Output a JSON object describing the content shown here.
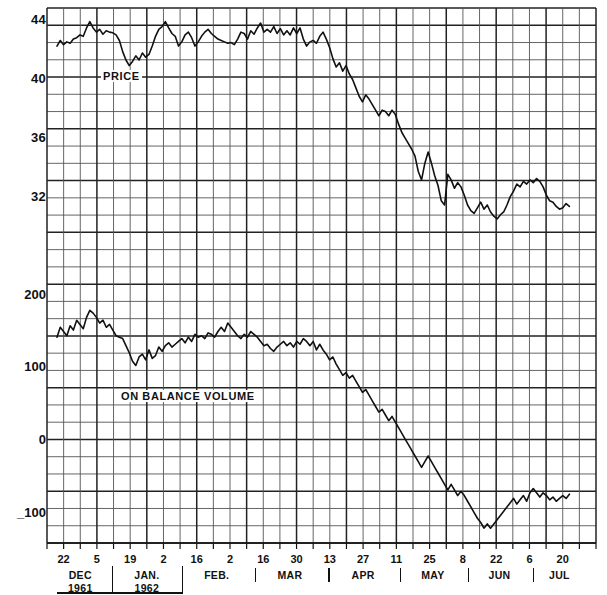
{
  "figure": {
    "background": "#ffffff",
    "line_color": "#111111",
    "grid_color": "#555555",
    "grid_bold_color": "#222222"
  },
  "panels": {
    "price": {
      "label": "PRICE",
      "y_ticks": [
        44,
        40,
        36,
        32
      ],
      "y_tick_labels": [
        "44",
        "40",
        "36",
        "32"
      ],
      "ylim": [
        28.0,
        45.33
      ]
    },
    "obv": {
      "label": "ON  BALANCE  VOLUME",
      "y_ticks": [
        200,
        100,
        0,
        -100
      ],
      "y_tick_labels": [
        "200",
        "100",
        "0",
        "_100"
      ],
      "ylim": [
        -133,
        233
      ]
    }
  },
  "x_axis": {
    "day_ticks": [
      "22",
      "5",
      "19",
      "2",
      "16",
      "2",
      "16",
      "30",
      "13",
      "27",
      "11",
      "25",
      "8",
      "22",
      "6",
      "20"
    ],
    "months": [
      {
        "name": "DEC",
        "year": "1961"
      },
      {
        "name": "JAN.",
        "year": "1962"
      },
      {
        "name": "FEB.",
        "year": ""
      },
      {
        "name": "MAR",
        "year": ""
      },
      {
        "name": "APR",
        "year": ""
      },
      {
        "name": "MAY",
        "year": ""
      },
      {
        "name": "JUN",
        "year": ""
      },
      {
        "name": "JUL",
        "year": ""
      }
    ]
  },
  "chart_data": {
    "type": "line",
    "title": "",
    "xlabel": "",
    "ylabel": "",
    "grid": true,
    "legend_position": "inline-annotation",
    "x_tick_labels": [
      "22",
      "5",
      "19",
      "2",
      "16",
      "2",
      "16",
      "30",
      "13",
      "27",
      "11",
      "25",
      "8",
      "22",
      "6",
      "20"
    ],
    "x_tick_months": [
      "DEC 1961",
      "JAN. 1962",
      "FEB.",
      "MAR",
      "APR",
      "MAY",
      "JUN",
      "JUL"
    ],
    "series": [
      {
        "name": "PRICE",
        "panel": "price",
        "ylabel": "Price",
        "ylim": [
          28.0,
          45.33
        ],
        "y_ticks": [
          44,
          40,
          36,
          32
        ],
        "values": [
          42.6,
          43.0,
          42.7,
          42.9,
          42.8,
          43.1,
          43.2,
          43.4,
          43.3,
          43.9,
          44.35,
          43.9,
          43.6,
          43.8,
          43.45,
          43.7,
          43.6,
          43.55,
          43.4,
          43.0,
          42.2,
          41.6,
          41.2,
          41.5,
          41.9,
          41.6,
          42.1,
          41.8,
          42.0,
          42.6,
          43.3,
          43.8,
          44.0,
          44.35,
          43.9,
          43.5,
          43.3,
          42.6,
          42.9,
          43.4,
          43.6,
          43.2,
          42.6,
          42.9,
          43.3,
          43.6,
          43.8,
          43.5,
          43.3,
          43.1,
          43.0,
          42.9,
          42.8,
          42.85,
          42.7,
          43.1,
          43.6,
          43.5,
          43.1,
          43.7,
          43.45,
          43.9,
          44.25,
          43.6,
          43.8,
          43.6,
          44.0,
          43.5,
          43.85,
          43.4,
          43.7,
          43.4,
          43.9,
          43.5,
          43.9,
          43.1,
          42.6,
          42.9,
          43.0,
          42.8,
          43.3,
          43.6,
          43.1,
          42.5,
          41.7,
          41.1,
          41.4,
          40.8,
          41.2,
          40.6,
          40.2,
          39.6,
          39.0,
          38.6,
          39.1,
          38.8,
          38.4,
          38.0,
          37.6,
          38.0,
          37.9,
          37.6,
          38.0,
          37.7,
          37.0,
          36.4,
          36.0,
          35.6,
          35.2,
          34.7,
          33.6,
          33.0,
          34.2,
          35.0,
          34.2,
          33.3,
          32.6,
          31.5,
          31.2,
          33.4,
          33.0,
          32.4,
          32.8,
          32.5,
          31.9,
          31.2,
          30.8,
          30.6,
          31.0,
          31.4,
          30.9,
          31.2,
          30.7,
          30.4,
          30.2,
          30.5,
          30.7,
          31.2,
          31.8,
          32.2,
          32.7,
          32.5,
          32.9,
          32.7,
          33.0,
          32.8,
          33.1,
          32.9,
          32.5,
          31.9,
          31.5,
          31.4,
          31.1,
          30.9,
          31.0,
          31.3,
          31.1
        ],
        "annotation": "PRICE"
      },
      {
        "name": "ON BALANCE VOLUME",
        "panel": "obv",
        "ylabel": "On Balance Volume",
        "ylim": [
          -133,
          233
        ],
        "y_ticks": [
          200,
          100,
          0,
          -100
        ],
        "values": [
          158,
          172,
          166,
          160,
          174,
          168,
          182,
          176,
          170,
          186,
          196,
          192,
          186,
          178,
          182,
          172,
          176,
          168,
          160,
          158,
          156,
          146,
          136,
          124,
          118,
          130,
          134,
          126,
          140,
          128,
          132,
          144,
          138,
          146,
          150,
          144,
          148,
          152,
          156,
          150,
          158,
          152,
          162,
          158,
          160,
          156,
          164,
          162,
          158,
          166,
          172,
          166,
          178,
          172,
          166,
          160,
          156,
          162,
          158,
          166,
          162,
          158,
          152,
          146,
          148,
          142,
          138,
          144,
          148,
          152,
          146,
          150,
          144,
          152,
          148,
          156,
          152,
          146,
          152,
          140,
          148,
          140,
          134,
          126,
          130,
          120,
          112,
          104,
          108,
          100,
          104,
          96,
          88,
          80,
          84,
          76,
          68,
          60,
          52,
          56,
          48,
          40,
          46,
          38,
          30,
          22,
          14,
          6,
          -2,
          -10,
          -18,
          -26,
          -18,
          -10,
          -18,
          -26,
          -34,
          -42,
          -50,
          -58,
          -50,
          -58,
          -66,
          -60,
          -66,
          -74,
          -82,
          -90,
          -98,
          -104,
          -112,
          -106,
          -112,
          -106,
          -100,
          -94,
          -88,
          -82,
          -76,
          -70,
          -78,
          -72,
          -66,
          -74,
          -62,
          -56,
          -62,
          -68,
          -62,
          -66,
          -72,
          -68,
          -74,
          -70,
          -66,
          -70,
          -64
        ],
        "annotation": "ON  BALANCE  VOLUME"
      }
    ]
  }
}
